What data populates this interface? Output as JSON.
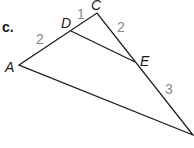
{
  "part_label": "c.",
  "vertices": {
    "A": {
      "label": "A",
      "x": 19,
      "y": 65
    },
    "C": {
      "label": "C",
      "x": 97,
      "y": 13
    },
    "D": {
      "label": "D",
      "x": 71,
      "y": 31
    },
    "E": {
      "label": "E",
      "x": 135,
      "y": 62
    },
    "B": {
      "label": "",
      "x": 193,
      "y": 135
    }
  },
  "segments": {
    "AD": "2",
    "DC": "1",
    "CE": "2",
    "EB": "3"
  },
  "colors": {
    "line": "#1a1a1a",
    "vertex_label": "#1a1a1a",
    "segment_label": "#8a8a8a"
  }
}
